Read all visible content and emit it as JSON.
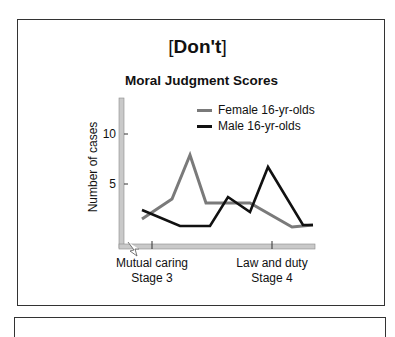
{
  "header": {
    "title_open": "[",
    "title_text": "Don't",
    "title_close": "]",
    "subtitle": "Moral Judgment Scores"
  },
  "axes": {
    "ylabel": "Number of cases",
    "yticks": [
      "10",
      "5"
    ],
    "xcategories": [
      {
        "line1": "Mutual caring",
        "line2": "Stage 3"
      },
      {
        "line1": "Law and duty",
        "line2": "Stage 4"
      }
    ]
  },
  "legend": [
    {
      "label": "Female 16-yr-olds",
      "color": "#7a7a7a"
    },
    {
      "label": "Male 16-yr-olds",
      "color": "#111111"
    }
  ],
  "colors": {
    "female": "#7a7a7a",
    "male": "#111111",
    "axis_bar": "#c8c8c8",
    "frame": "#333333"
  },
  "chart_data": {
    "type": "line",
    "title": "Moral Judgment Scores",
    "header": "[Don't]",
    "xlabel": "",
    "ylabel": "Number of cases",
    "x_tick_labels": [
      "Mutual caring\nStage 3",
      "Law and duty\nStage 4"
    ],
    "y_ticks": [
      5,
      10
    ],
    "ylim": [
      0,
      13.5
    ],
    "x": [
      1,
      2,
      3,
      4,
      5,
      6,
      7,
      8
    ],
    "series": [
      {
        "name": "Female 16-yr-olds",
        "color": "#7a7a7a",
        "values": [
          1.5,
          3.5,
          7.9,
          3.1,
          3.1,
          3.1,
          0.7,
          0.9
        ]
      },
      {
        "name": "Male 16-yr-olds",
        "color": "#111111",
        "values": [
          2.4,
          0.8,
          0.8,
          3.7,
          2.2,
          6.7,
          0.9,
          0.9
        ]
      }
    ],
    "legend_position": "upper right",
    "grid": false
  }
}
